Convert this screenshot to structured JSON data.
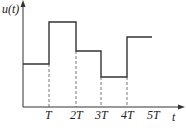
{
  "diagram": {
    "type": "step-signal-plot",
    "y_axis_label": "u(t)",
    "x_axis_label": "t",
    "x_ticks": [
      "T",
      "2T",
      "3T",
      "4T",
      "5T"
    ],
    "colors": {
      "line": "#333333",
      "axis": "#333333",
      "dashed": "#555555",
      "background": "#ffffff"
    },
    "segments": [
      {
        "from": "0",
        "to": "T",
        "level": "low-mid"
      },
      {
        "from": "T",
        "to": "2T",
        "level": "highest"
      },
      {
        "from": "2T",
        "to": "3T",
        "level": "mid"
      },
      {
        "from": "3T",
        "to": "4T",
        "level": "lowest"
      },
      {
        "from": "4T",
        "to": "5T",
        "level": "high"
      }
    ]
  }
}
